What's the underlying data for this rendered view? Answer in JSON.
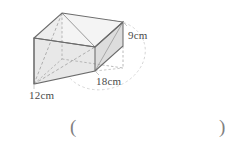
{
  "figure": {
    "name": "rectangular-prism",
    "type": "cuboid",
    "dimensions": {
      "height": {
        "value": 9,
        "unit": "cm",
        "label": "9cm"
      },
      "length": {
        "value": 18,
        "unit": "cm",
        "label": "18cm"
      },
      "width": {
        "value": 12,
        "unit": "cm",
        "label": "12cm"
      }
    },
    "colors": {
      "edge": "#6b6b6b",
      "hidden_edge": "#9a9a9a",
      "face_light": "#f2f2f2",
      "face_mid": "#e6e6e6",
      "face_dark": "#dadada",
      "ellipse": "#cfcfcf",
      "text": "#4a4a4a",
      "paren": "#808080"
    }
  },
  "answer": {
    "open_paren": "(",
    "close_paren": ")",
    "value": ""
  }
}
